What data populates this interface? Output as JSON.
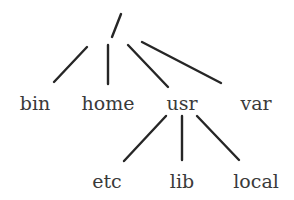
{
  "diagram": {
    "colors": {
      "line": "#262626",
      "text": "#3a3a3a",
      "background": "#ffffff"
    },
    "root": {
      "label": "/",
      "x": 116,
      "y": 26
    },
    "nodes": [
      {
        "id": "bin",
        "label": "bin",
        "x": 35,
        "y": 110,
        "parent": "root"
      },
      {
        "id": "home",
        "label": "home",
        "x": 108,
        "y": 110,
        "parent": "root"
      },
      {
        "id": "usr",
        "label": "usr",
        "x": 182,
        "y": 110,
        "parent": "root"
      },
      {
        "id": "var",
        "label": "var",
        "x": 256,
        "y": 110,
        "parent": "root"
      },
      {
        "id": "etc",
        "label": "etc",
        "x": 107,
        "y": 188,
        "parent": "usr"
      },
      {
        "id": "lib",
        "label": "lib",
        "x": 182,
        "y": 188,
        "parent": "usr"
      },
      {
        "id": "local",
        "label": "local",
        "x": 256,
        "y": 188,
        "parent": "usr"
      }
    ],
    "edges": [
      {
        "from": "root",
        "to": "bin",
        "x1": 87,
        "y1": 47,
        "x2": 54,
        "y2": 82
      },
      {
        "from": "root",
        "to": "home",
        "x1": 108,
        "y1": 45,
        "x2": 108,
        "y2": 84
      },
      {
        "from": "root",
        "to": "usr",
        "x1": 128,
        "y1": 45,
        "x2": 168,
        "y2": 87
      },
      {
        "from": "root",
        "to": "var",
        "x1": 142,
        "y1": 42,
        "x2": 221,
        "y2": 83
      },
      {
        "from": "usr",
        "to": "etc",
        "x1": 166,
        "y1": 116,
        "x2": 124,
        "y2": 161
      },
      {
        "from": "usr",
        "to": "lib",
        "x1": 182,
        "y1": 116,
        "x2": 182,
        "y2": 160
      },
      {
        "from": "usr",
        "to": "local",
        "x1": 197,
        "y1": 116,
        "x2": 239,
        "y2": 160
      }
    ]
  }
}
